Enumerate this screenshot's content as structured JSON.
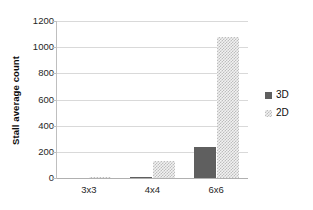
{
  "chart_data": {
    "type": "bar",
    "title": "",
    "subtitle": "",
    "xlabel": "",
    "ylabel": "Stall average count",
    "categories": [
      "3x3",
      "4x4",
      "6x6"
    ],
    "series": [
      {
        "name": "3D",
        "values": [
          0,
          3,
          237
        ],
        "color": "#5f5f5f",
        "fill": "solid"
      },
      {
        "name": "2D",
        "values": [
          2,
          130,
          1075
        ],
        "color": "#bdbdbd",
        "fill": "checkered"
      }
    ],
    "ylim": [
      0,
      1200
    ],
    "yticks": [
      0,
      200,
      400,
      600,
      800,
      1000,
      1200
    ],
    "ytick_labels": [
      "0",
      "200",
      "400",
      "600",
      "800",
      "1000",
      "1200"
    ],
    "grid": "horizontal",
    "legend_position": "right",
    "legend_entries": [
      "3D",
      "2D"
    ]
  }
}
